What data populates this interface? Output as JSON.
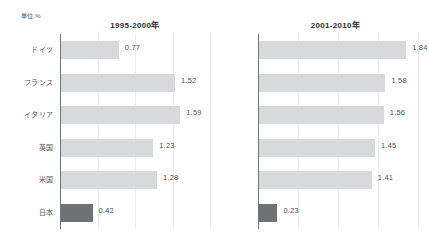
{
  "unit_label": "単位:%",
  "chart_data": {
    "type": "bar",
    "title": "",
    "orientation": "horizontal",
    "categories": [
      "ドイツ",
      "フランス",
      "イタリア",
      "英国",
      "米国",
      "日本"
    ],
    "xlabel": "",
    "ylabel": "",
    "unit": "%",
    "xlim": [
      0,
      2.0
    ],
    "grid": true,
    "gridline_values": [
      0.5,
      1.0,
      1.5,
      2.0
    ],
    "legend": "none",
    "highlight_category": "日本",
    "colors": {
      "bar": "#d7d9da",
      "bar_highlight": "#6f7274",
      "axis": "#6f757a",
      "gridline": "#ededed",
      "label_text": "#55595d",
      "value_text": "#4e5357",
      "title_text": "#2b2f33",
      "background": "#ffffff"
    },
    "panels": [
      {
        "title": "1995-2000年",
        "values": [
          0.77,
          1.52,
          1.59,
          1.23,
          1.28,
          0.42
        ],
        "value_labels": [
          "0.77",
          "1.52",
          "1.59",
          "1.23",
          "1.28",
          "0.42"
        ]
      },
      {
        "title": "2001-2010年",
        "values": [
          1.84,
          1.58,
          1.56,
          1.45,
          1.41,
          0.23
        ],
        "value_labels": [
          "1.84",
          "1.58",
          "1.56",
          "1.45",
          "1.41",
          "0.23"
        ]
      }
    ]
  }
}
